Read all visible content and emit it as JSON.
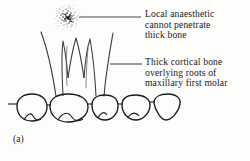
{
  "figure": {
    "label": "(a)",
    "background_color": "#fdfdfc",
    "ink_color": "#1a1a1a"
  },
  "callouts": [
    {
      "id": "local-anaesthetic",
      "lines": [
        "Local  anaesthetic",
        "cannot  penetrate",
        "thick  bone"
      ],
      "leader_line": {
        "x1": 79,
        "y1": 17,
        "x2": 141,
        "y2": 17
      }
    },
    {
      "id": "thick-cortical-bone",
      "lines": [
        "Thick  cortical bone",
        "overlying roots of",
        "maxillary first molar"
      ],
      "leader_line": {
        "x1": 110,
        "y1": 64,
        "x2": 142,
        "y2": 64
      }
    }
  ],
  "anatomy": {
    "anaesthetic_deposit": {
      "name": "stippled-anaesthetic-cloud",
      "center_x": 68,
      "center_y": 17,
      "radius_x": 11,
      "radius_y": 12,
      "dot_count": 230
    },
    "molar_roots": {
      "name": "maxillary-first-molar-roots",
      "root_count": 3,
      "apex_y": 36,
      "crown_y": 96
    },
    "cortical_bone_outline": {
      "name": "cortical-bone-overlay",
      "left_x": 41,
      "right_x": 113,
      "top_y": 32,
      "bottom_y": 97
    },
    "tooth_crowns": {
      "name": "occlusal-tooth-row",
      "count": 5,
      "baseline_y": 97,
      "labels": [
        "second-premolar",
        "first-molar",
        "second-molar",
        "third-molar-a",
        "third-molar-b"
      ]
    }
  }
}
